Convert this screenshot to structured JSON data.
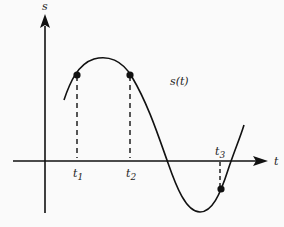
{
  "axes": {
    "y_label": "s",
    "x_label": "t"
  },
  "curve": {
    "label": "s(t)",
    "description": "position function s(t) versus time t"
  },
  "points": [
    {
      "label": "t",
      "subscript": "1"
    },
    {
      "label": "t",
      "subscript": "2"
    },
    {
      "label": "t",
      "subscript": "3"
    }
  ],
  "colors": {
    "stroke": "#111111",
    "background": "#fafafa"
  }
}
